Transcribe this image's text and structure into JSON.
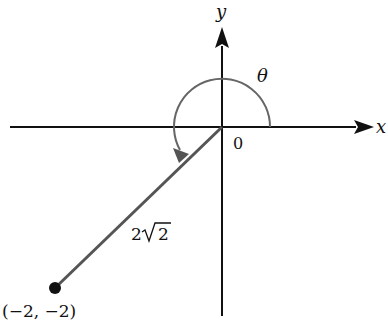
{
  "diagram": {
    "type": "polar-angle-diagram",
    "labels": {
      "x_axis": "x",
      "y_axis": "y",
      "origin": "0",
      "angle": "θ",
      "length": "2√2",
      "length_coefficient": "2",
      "length_radicand": "2",
      "point": "(−2, −2)"
    },
    "point": {
      "x": -2,
      "y": -2
    },
    "radius": "2√2",
    "colors": {
      "axis": "#111111",
      "segment": "#555555",
      "arc": "#666666",
      "point": "#111111",
      "text": "#111111"
    },
    "geometry_px": {
      "origin": [
        222,
        127
      ],
      "x_axis": {
        "from": [
          10,
          127
        ],
        "to": [
          372,
          127
        ]
      },
      "y_axis": {
        "from": [
          222,
          316
        ],
        "to": [
          222,
          26
        ]
      },
      "arc_radius": 48,
      "point": [
        55,
        288
      ],
      "point_radius": 6
    }
  }
}
